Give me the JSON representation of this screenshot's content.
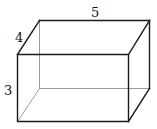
{
  "figure": {
    "type": "rectangular-prism",
    "dimensions": {
      "length": "5",
      "width": "4",
      "height": "3"
    }
  }
}
